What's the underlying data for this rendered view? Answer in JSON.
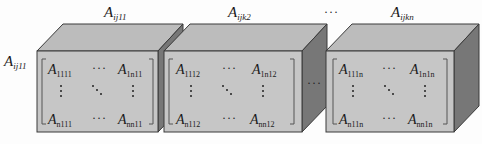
{
  "diagram": {
    "type": "tensor-as-stacked-matrix-boxes",
    "colors": {
      "front_face": "#c4c4c4",
      "top_face": "#b9b9b9",
      "side_face": "#7a7a7a",
      "edge": "#3a3a3a",
      "bracket": "#555555"
    },
    "top_labels": [
      {
        "base": "A",
        "sub": "ij11"
      },
      {
        "base": "A",
        "sub": "ijk2"
      },
      {
        "ellipsis": "···"
      },
      {
        "base": "A",
        "sub": "ijkn"
      }
    ],
    "left_label": {
      "base": "A",
      "sub": "ij11"
    },
    "between_ellipsis": "···",
    "boxes": [
      {
        "cells": {
          "top_left": {
            "base": "A",
            "sub": "1111"
          },
          "top_mid": "···",
          "top_right": {
            "base": "A",
            "sub": "1n11"
          },
          "bot_left": {
            "base": "A",
            "sub": "n111"
          },
          "bot_mid": "···",
          "bot_right": {
            "base": "A",
            "sub": "nn11"
          }
        }
      },
      {
        "cells": {
          "top_left": {
            "base": "A",
            "sub": "1112"
          },
          "top_mid": "···",
          "top_right": {
            "base": "A",
            "sub": "1n12"
          },
          "bot_left": {
            "base": "A",
            "sub": "n112"
          },
          "bot_mid": "···",
          "bot_right": {
            "base": "A",
            "sub": "nn12"
          }
        }
      },
      {
        "cells": {
          "top_left": {
            "base": "A",
            "sub": "111n"
          },
          "top_mid": "···",
          "top_right": {
            "base": "A",
            "sub": "1n1n"
          },
          "bot_left": {
            "base": "A",
            "sub": "n11n"
          },
          "bot_mid": "···",
          "bot_right": {
            "base": "A",
            "sub": "nn1n"
          }
        }
      }
    ]
  }
}
